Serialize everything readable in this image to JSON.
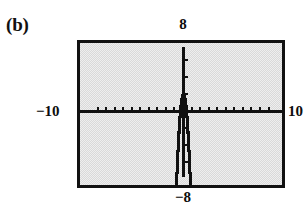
{
  "figure": {
    "part_label": "(b)",
    "type": "graphing-calculator-screen"
  },
  "window_labels": {
    "ymax": "8",
    "ymin": "−8",
    "xmin": "−10",
    "xmax": "10"
  },
  "colors": {
    "screen_background": "#d9d9d9",
    "frame": "#111111",
    "ink": "#101010",
    "page": "#ffffff"
  },
  "chart_data": {
    "type": "line",
    "title": "",
    "subtitle": "",
    "xlabel": "",
    "ylabel": "",
    "xlim": [
      -10,
      10
    ],
    "ylim": [
      -8,
      8
    ],
    "xtick_step": 1,
    "ytick_step": 1,
    "grid": false,
    "legend": null,
    "annotations": [],
    "tick_labels": {
      "x": [
        "−10",
        "10"
      ],
      "y": [
        "−8",
        "8"
      ]
    },
    "series": [
      {
        "name": "y = -8x^2 + 1",
        "equation": "y = -8x² + 1",
        "vertex": [
          0,
          1
        ],
        "opens": "down",
        "x": [
          -1.05,
          -1.0,
          -0.95,
          -0.9,
          -0.85,
          -0.8,
          -0.75,
          -0.7,
          -0.65,
          -0.6,
          -0.55,
          -0.5,
          -0.45,
          -0.4,
          -0.35,
          -0.3,
          -0.25,
          -0.2,
          -0.15,
          -0.1,
          -0.05,
          0.0,
          0.05,
          0.1,
          0.15,
          0.2,
          0.25,
          0.3,
          0.35,
          0.4,
          0.45,
          0.5,
          0.55,
          0.6,
          0.65,
          0.7,
          0.75,
          0.8,
          0.85,
          0.9,
          0.95,
          1.0,
          1.05
        ],
        "y": [
          -7.82,
          -7.0,
          -6.22,
          -5.48,
          -4.78,
          -4.12,
          -3.5,
          -2.92,
          -2.38,
          -1.88,
          -1.42,
          -1.0,
          -0.62,
          -0.28,
          0.02,
          0.28,
          0.5,
          0.68,
          0.82,
          0.92,
          0.98,
          1.0,
          0.98,
          0.92,
          0.82,
          0.68,
          0.5,
          0.28,
          0.02,
          -0.28,
          -0.62,
          -1.0,
          -1.42,
          -1.88,
          -2.38,
          -2.92,
          -3.5,
          -4.12,
          -4.78,
          -5.48,
          -6.22,
          -7.0,
          -7.82
        ]
      }
    ]
  }
}
